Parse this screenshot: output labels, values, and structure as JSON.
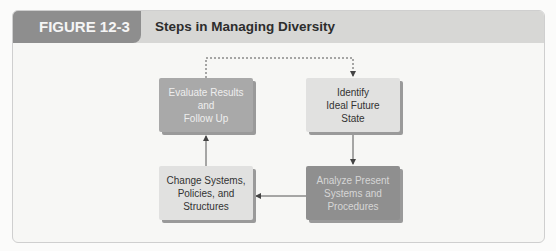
{
  "header": {
    "figure_label": "FIGURE 12-3",
    "title": "Steps in Managing Diversity"
  },
  "diagram": {
    "steps": [
      {
        "id": "evaluate",
        "label": "Evaluate Results\nand\nFollow Up"
      },
      {
        "id": "identify",
        "label": "Identify\nIdeal Future\nState"
      },
      {
        "id": "analyze",
        "label": "Analyze Present\nSystems and\nProcedures"
      },
      {
        "id": "change",
        "label": "Change Systems,\nPolicies, and\nStructures"
      }
    ],
    "connections": [
      {
        "from": "evaluate",
        "to": "identify",
        "style": "dashed"
      },
      {
        "from": "identify",
        "to": "analyze",
        "style": "solid"
      },
      {
        "from": "analyze",
        "to": "change",
        "style": "solid"
      },
      {
        "from": "change",
        "to": "evaluate",
        "style": "solid"
      }
    ]
  }
}
